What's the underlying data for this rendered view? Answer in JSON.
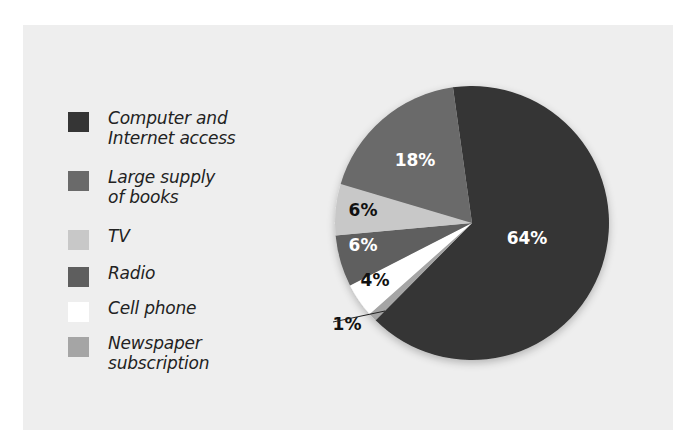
{
  "chart_data": {
    "type": "pie",
    "title": "",
    "categories": [
      "Computer and Internet access",
      "Large supply of books",
      "TV",
      "Radio",
      "Cell phone",
      "Newspaper subscription"
    ],
    "values": [
      64,
      18,
      6,
      6,
      4,
      1
    ],
    "labels": [
      "64%",
      "18%",
      "6%",
      "6%",
      "4%",
      "1%"
    ],
    "colors": [
      "#353535",
      "#6a6a6a",
      "#c8c8c8",
      "#5e5e5e",
      "#ffffff",
      "#a5a5a5"
    ],
    "legend_position": "left"
  },
  "legend": {
    "items": [
      {
        "label": "Computer and\nInternet access",
        "color": "#353535"
      },
      {
        "label": "Large supply\nof books",
        "color": "#6a6a6a"
      },
      {
        "label": "TV",
        "color": "#c8c8c8"
      },
      {
        "label": "Radio",
        "color": "#5e5e5e"
      },
      {
        "label": "Cell phone",
        "color": "#ffffff"
      },
      {
        "label": "Newspaper\nsubscription",
        "color": "#a5a5a5"
      }
    ]
  }
}
